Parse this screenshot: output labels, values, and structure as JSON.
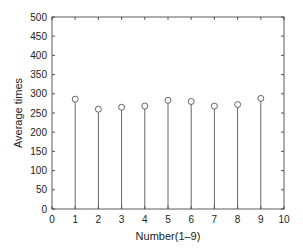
{
  "chart_data": {
    "type": "stem",
    "title": "",
    "xlabel": "Number(1–9)",
    "ylabel": "Average times",
    "x": [
      1,
      2,
      3,
      4,
      5,
      6,
      7,
      8,
      9
    ],
    "values": [
      286,
      260,
      265,
      268,
      283,
      280,
      268,
      272,
      288
    ],
    "xlim": [
      0,
      10
    ],
    "ylim": [
      0,
      500
    ],
    "xticks": [
      0,
      1,
      2,
      3,
      4,
      5,
      6,
      7,
      8,
      9,
      10
    ],
    "yticks": [
      0,
      50,
      100,
      150,
      200,
      250,
      300,
      350,
      400,
      450,
      500
    ],
    "grid": false,
    "legend": null,
    "marker": "circle-open",
    "colors": {
      "stem": "#555555",
      "axis": "#333333"
    }
  }
}
